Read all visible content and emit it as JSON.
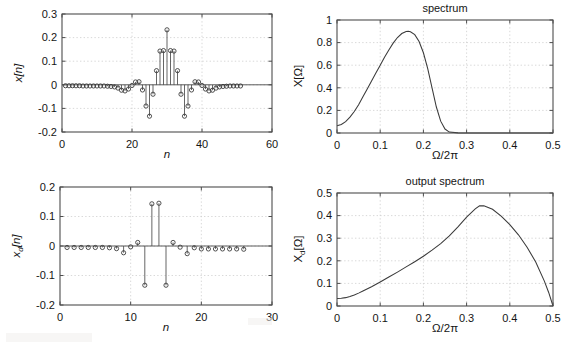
{
  "figure": {
    "width": 564,
    "height": 346,
    "background": "#ffffff",
    "axis_color": "#4d4d4d",
    "grid_color": "#c9c9c9",
    "curve_color": "#3a3a3a"
  },
  "panels": {
    "input_signal": {
      "name": "x[n] stem plot",
      "title": "",
      "ylabel": "x[n]",
      "xlabel": "n",
      "xticks": [
        "0",
        "20",
        "40",
        "60"
      ],
      "yticks": [
        "-0.2",
        "-0.1",
        "0",
        "0.1",
        "0.2",
        "0.3"
      ]
    },
    "spectrum": {
      "name": "spectrum",
      "title": "spectrum",
      "ylabel": "X[Ω]",
      "xlabel": "Ω/2π",
      "xticks": [
        "0",
        "0.1",
        "0.2",
        "0.3",
        "0.4",
        "0.5"
      ],
      "yticks": [
        "0",
        "0.2",
        "0.4",
        "0.6",
        "0.8",
        "1"
      ]
    },
    "decimated_signal": {
      "name": "x_d[n] stem plot",
      "title": "",
      "ylabel": "x_d[n]",
      "ylabel_main": "x",
      "ylabel_sub": "d",
      "ylabel_tail": "[n]",
      "xlabel": "n",
      "xticks": [
        "0",
        "10",
        "20",
        "30"
      ],
      "yticks": [
        "-0.2",
        "-0.1",
        "0",
        "0.1",
        "0.2"
      ]
    },
    "output_spectrum": {
      "name": "output spectrum",
      "title": "output spectrum",
      "ylabel": "X_d[Ω]",
      "ylabel_main": "X",
      "ylabel_sub": "d",
      "ylabel_tail": "[Ω]",
      "xlabel": "Ω/2π",
      "xticks": [
        "0",
        "0.1",
        "0.2",
        "0.3",
        "0.4",
        "0.5"
      ],
      "yticks": [
        "0",
        "0.1",
        "0.2",
        "0.3",
        "0.4",
        "0.5"
      ]
    }
  },
  "chart_data": [
    {
      "id": "input_signal",
      "type": "stem",
      "title": "",
      "xlabel": "n",
      "ylabel": "x[n]",
      "xlim": [
        0,
        60
      ],
      "ylim": [
        -0.2,
        0.3
      ],
      "xticks": [
        0,
        20,
        40,
        60
      ],
      "yticks": [
        -0.2,
        -0.1,
        0,
        0.1,
        0.2,
        0.3
      ],
      "grid": true,
      "legend": null,
      "x": [
        1,
        2,
        3,
        4,
        5,
        6,
        7,
        8,
        9,
        10,
        11,
        12,
        13,
        14,
        15,
        16,
        17,
        18,
        19,
        20,
        21,
        22,
        23,
        24,
        25,
        26,
        27,
        28,
        29,
        30,
        31,
        32,
        33,
        34,
        35,
        36,
        37,
        38,
        39,
        40,
        41,
        42,
        43,
        44,
        45,
        46,
        47,
        48,
        49,
        50,
        51
      ],
      "values": [
        -0.004,
        -0.004,
        -0.004,
        -0.004,
        -0.004,
        -0.005,
        -0.005,
        -0.005,
        -0.005,
        -0.005,
        -0.005,
        -0.005,
        -0.006,
        -0.007,
        -0.009,
        -0.014,
        -0.023,
        -0.026,
        -0.018,
        -0.003,
        0.012,
        0.013,
        -0.022,
        -0.09,
        -0.133,
        -0.04,
        0.06,
        0.143,
        0.145,
        0.233,
        0.145,
        0.143,
        0.06,
        -0.04,
        -0.133,
        -0.09,
        -0.022,
        0.013,
        0.012,
        -0.003,
        -0.018,
        -0.026,
        -0.023,
        -0.014,
        -0.009,
        -0.007,
        -0.006,
        -0.005,
        -0.005,
        -0.005,
        -0.005
      ]
    },
    {
      "id": "spectrum",
      "type": "line",
      "title": "spectrum",
      "xlabel": "Ω/2π",
      "ylabel": "X[Ω]",
      "xlim": [
        0,
        0.5
      ],
      "ylim": [
        0,
        1
      ],
      "xticks": [
        0,
        0.1,
        0.2,
        0.3,
        0.4,
        0.5
      ],
      "yticks": [
        0,
        0.2,
        0.4,
        0.6,
        0.8,
        1
      ],
      "grid": true,
      "legend": null,
      "x": [
        0,
        0.01,
        0.02,
        0.03,
        0.04,
        0.05,
        0.06,
        0.07,
        0.08,
        0.09,
        0.1,
        0.11,
        0.12,
        0.13,
        0.14,
        0.15,
        0.16,
        0.165,
        0.17,
        0.18,
        0.19,
        0.2,
        0.21,
        0.22,
        0.23,
        0.24,
        0.25,
        0.26,
        0.28,
        0.3,
        0.35,
        0.4,
        0.45,
        0.5
      ],
      "values": [
        0.065,
        0.075,
        0.1,
        0.14,
        0.19,
        0.25,
        0.32,
        0.39,
        0.46,
        0.53,
        0.6,
        0.67,
        0.735,
        0.795,
        0.845,
        0.88,
        0.898,
        0.9,
        0.896,
        0.87,
        0.81,
        0.71,
        0.57,
        0.4,
        0.23,
        0.105,
        0.035,
        0.008,
        0.001,
        0.0,
        0.0,
        0.0,
        0.0,
        0.0
      ]
    },
    {
      "id": "decimated_signal",
      "type": "stem",
      "title": "",
      "xlabel": "n",
      "ylabel": "x_d[n]",
      "xlim": [
        0,
        30
      ],
      "ylim": [
        -0.2,
        0.2
      ],
      "xticks": [
        0,
        10,
        20,
        30
      ],
      "yticks": [
        -0.2,
        -0.1,
        0,
        0.1,
        0.2
      ],
      "grid": true,
      "legend": null,
      "x": [
        1,
        2,
        3,
        4,
        5,
        6,
        7,
        8,
        9,
        10,
        11,
        12,
        13,
        14,
        15,
        16,
        17,
        18,
        19,
        20,
        21,
        22,
        23,
        24,
        25,
        26
      ],
      "values": [
        -0.005,
        -0.005,
        -0.005,
        -0.005,
        -0.005,
        -0.005,
        -0.006,
        -0.009,
        -0.023,
        -0.003,
        0.012,
        -0.133,
        0.143,
        0.145,
        -0.133,
        0.012,
        -0.004,
        -0.026,
        -0.006,
        -0.01,
        -0.01,
        -0.01,
        -0.01,
        -0.01,
        -0.01,
        -0.011
      ]
    },
    {
      "id": "output_spectrum",
      "type": "line",
      "title": "output spectrum",
      "xlabel": "Ω/2π",
      "ylabel": "X_d[Ω]",
      "xlim": [
        0,
        0.5
      ],
      "ylim": [
        0,
        0.5
      ],
      "xticks": [
        0,
        0.1,
        0.2,
        0.3,
        0.4,
        0.5
      ],
      "yticks": [
        0,
        0.1,
        0.2,
        0.3,
        0.4,
        0.5
      ],
      "grid": true,
      "legend": null,
      "x": [
        0,
        0.01,
        0.02,
        0.03,
        0.04,
        0.05,
        0.06,
        0.08,
        0.1,
        0.12,
        0.14,
        0.16,
        0.18,
        0.2,
        0.22,
        0.24,
        0.26,
        0.28,
        0.3,
        0.32,
        0.33,
        0.34,
        0.36,
        0.38,
        0.4,
        0.42,
        0.44,
        0.46,
        0.48,
        0.49,
        0.5
      ],
      "values": [
        0.033,
        0.034,
        0.037,
        0.042,
        0.049,
        0.057,
        0.066,
        0.085,
        0.106,
        0.128,
        0.15,
        0.173,
        0.196,
        0.22,
        0.247,
        0.276,
        0.31,
        0.35,
        0.393,
        0.43,
        0.443,
        0.444,
        0.428,
        0.398,
        0.36,
        0.315,
        0.26,
        0.195,
        0.11,
        0.06,
        0.0
      ]
    }
  ]
}
